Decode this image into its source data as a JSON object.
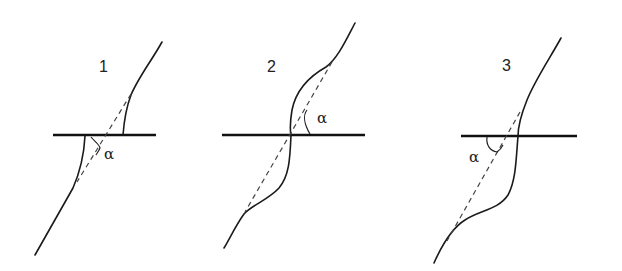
{
  "figure": {
    "panels": [
      {
        "label": "1",
        "angle_symbol": "α"
      },
      {
        "label": "2",
        "angle_symbol": "α"
      },
      {
        "label": "3",
        "angle_symbol": "α"
      }
    ],
    "colors": {
      "line": "#111111",
      "background": "#ffffff"
    }
  }
}
